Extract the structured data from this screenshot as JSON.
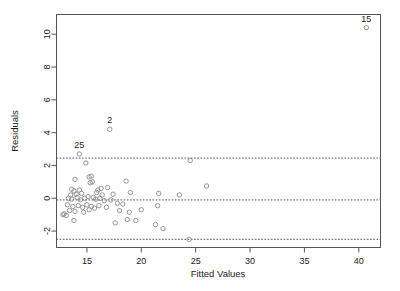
{
  "chart_data": {
    "type": "scatter",
    "title": "",
    "xlabel": "Fitted Values",
    "ylabel": "Residuals",
    "xlim": [
      12.2,
      42.0
    ],
    "ylim": [
      -3.0,
      11.2
    ],
    "xticks": [
      15,
      20,
      25,
      30,
      35,
      40
    ],
    "yticks": [
      -2,
      0,
      2,
      4,
      6,
      8,
      10
    ],
    "xtick_labels": [
      "15",
      "20",
      "25",
      "30",
      "35",
      "40"
    ],
    "ytick_labels": [
      "-2",
      "0",
      "2",
      "4",
      "6",
      "8",
      "10"
    ],
    "grid": false,
    "legend": "none",
    "reference_lines": [
      {
        "name": "upper-bound",
        "y": 2.45,
        "style": "dotted"
      },
      {
        "name": "zero-line",
        "y": -0.1,
        "style": "dotted"
      },
      {
        "name": "lower-bound",
        "y": -2.5,
        "style": "dotted"
      }
    ],
    "annotations": [
      {
        "label": "15",
        "x": 40.7,
        "y": 10.4
      },
      {
        "label": "2",
        "x": 17.1,
        "y": 4.2
      },
      {
        "label": "25",
        "x": 14.3,
        "y": 2.7
      }
    ],
    "points": [
      {
        "x": 40.7,
        "y": 10.4
      },
      {
        "x": 17.1,
        "y": 4.2
      },
      {
        "x": 14.3,
        "y": 2.7
      },
      {
        "x": 14.9,
        "y": 2.15
      },
      {
        "x": 24.5,
        "y": 2.3
      },
      {
        "x": 15.4,
        "y": 1.35
      },
      {
        "x": 15.2,
        "y": 1.3
      },
      {
        "x": 15.5,
        "y": 1.0
      },
      {
        "x": 15.3,
        "y": 0.95
      },
      {
        "x": 13.9,
        "y": 1.15
      },
      {
        "x": 18.6,
        "y": 1.05
      },
      {
        "x": 16.9,
        "y": 0.65
      },
      {
        "x": 16.3,
        "y": 0.6
      },
      {
        "x": 13.6,
        "y": 0.55
      },
      {
        "x": 13.8,
        "y": 0.45
      },
      {
        "x": 14.3,
        "y": 0.5
      },
      {
        "x": 16.0,
        "y": 0.5
      },
      {
        "x": 15.9,
        "y": 0.35
      },
      {
        "x": 14.5,
        "y": 0.3
      },
      {
        "x": 14.0,
        "y": 0.25
      },
      {
        "x": 13.5,
        "y": 0.2
      },
      {
        "x": 16.4,
        "y": 0.2
      },
      {
        "x": 17.4,
        "y": 0.25
      },
      {
        "x": 26.0,
        "y": 0.75
      },
      {
        "x": 21.6,
        "y": 0.3
      },
      {
        "x": 23.5,
        "y": 0.2
      },
      {
        "x": 19.0,
        "y": 0.35
      },
      {
        "x": 13.3,
        "y": 0.0
      },
      {
        "x": 13.6,
        "y": -0.05
      },
      {
        "x": 14.1,
        "y": 0.05
      },
      {
        "x": 14.4,
        "y": -0.1
      },
      {
        "x": 14.8,
        "y": 0.0
      },
      {
        "x": 15.1,
        "y": 0.1
      },
      {
        "x": 15.6,
        "y": 0.05
      },
      {
        "x": 15.8,
        "y": -0.05
      },
      {
        "x": 16.2,
        "y": 0.0
      },
      {
        "x": 16.6,
        "y": -0.15
      },
      {
        "x": 17.2,
        "y": -0.1
      },
      {
        "x": 17.8,
        "y": -0.3
      },
      {
        "x": 18.3,
        "y": -0.35
      },
      {
        "x": 13.2,
        "y": -0.4
      },
      {
        "x": 13.7,
        "y": -0.5
      },
      {
        "x": 14.2,
        "y": -0.45
      },
      {
        "x": 14.6,
        "y": -0.55
      },
      {
        "x": 15.0,
        "y": -0.4
      },
      {
        "x": 15.4,
        "y": -0.5
      },
      {
        "x": 15.7,
        "y": -0.6
      },
      {
        "x": 16.1,
        "y": -0.45
      },
      {
        "x": 16.8,
        "y": -0.55
      },
      {
        "x": 13.4,
        "y": -0.75
      },
      {
        "x": 13.9,
        "y": -0.8
      },
      {
        "x": 14.7,
        "y": -0.85
      },
      {
        "x": 15.2,
        "y": -0.7
      },
      {
        "x": 12.9,
        "y": -0.95
      },
      {
        "x": 13.1,
        "y": -1.05
      },
      {
        "x": 13.8,
        "y": -1.35
      },
      {
        "x": 12.8,
        "y": -1.0
      },
      {
        "x": 18.0,
        "y": -0.75
      },
      {
        "x": 18.9,
        "y": -0.85
      },
      {
        "x": 20.0,
        "y": -0.7
      },
      {
        "x": 21.5,
        "y": -0.45
      },
      {
        "x": 17.6,
        "y": -1.5
      },
      {
        "x": 18.7,
        "y": -1.3
      },
      {
        "x": 19.5,
        "y": -1.35
      },
      {
        "x": 21.3,
        "y": -1.6
      },
      {
        "x": 22.0,
        "y": -1.85
      },
      {
        "x": 24.4,
        "y": -2.5
      }
    ]
  },
  "axis": {
    "x_title": "Fitted Values",
    "y_title": "Residuals"
  }
}
